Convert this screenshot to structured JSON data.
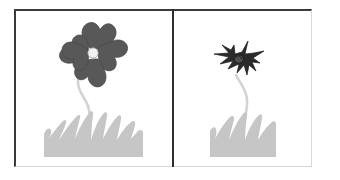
{
  "figure": {
    "panel_count": 2,
    "background_color": "#ffffff",
    "frame": {
      "border_dark_color": "#3a3a3c",
      "border_light_color": "#d8d8d8",
      "divider_color": "#2f2f31"
    }
  },
  "panels": [
    {
      "id": "left",
      "name": "healthy-flower-panel",
      "subject": "healthy flower",
      "description": "A five-petal flower in medium gray with a small white center, on a slender pale wavy stem rising from a patch of light gray grass.",
      "flower": {
        "state": "healthy",
        "petal_count": 5,
        "petal_color": "#585858",
        "petal_outline_color": "#4a4a4a",
        "center_color": "#f2f2f2",
        "center_outline_color": "#9a9a9a",
        "stem_color": "#d3d3d3",
        "stem_style": "wavy"
      },
      "grass": {
        "color": "#c6c6c6",
        "blade_count": 7
      }
    },
    {
      "id": "right",
      "name": "wilted-flower-panel",
      "subject": "wilted flower",
      "description": "A shrivelled dark spiky flower head with shrunken curled petals, on a pale wavy stem rising from a smaller patch of light gray grass.",
      "flower": {
        "state": "wilted",
        "petal_count": 5,
        "petal_color": "#2b2b2b",
        "petal_outline_color": "#1d1d1d",
        "center_color": "#4f4f4f",
        "center_outline_color": "#1d1d1d",
        "stem_color": "#d3d3d3",
        "stem_style": "wavy"
      },
      "grass": {
        "color": "#c6c6c6",
        "blade_count": 5
      }
    }
  ],
  "colors": {
    "page_background": "#ffffff",
    "healthy_petal": "#585858",
    "wilted_petal": "#2b2b2b",
    "grass": "#c6c6c6",
    "stem": "#d3d3d3",
    "flower_center": "#f2f2f2"
  },
  "labels": {
    "left_caption": "",
    "right_caption": ""
  }
}
